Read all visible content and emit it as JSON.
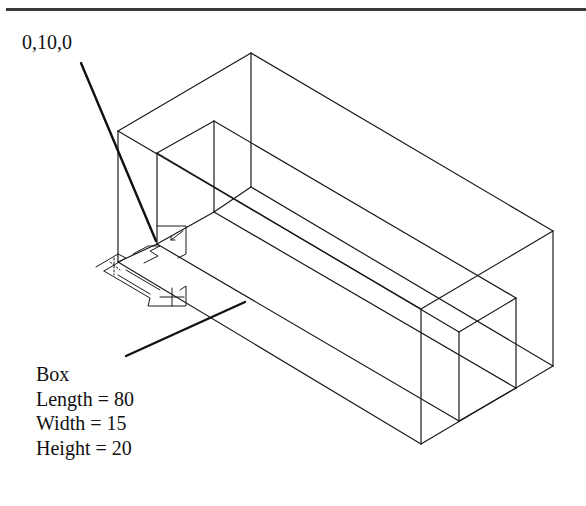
{
  "diagram": {
    "type": "isometric-wireframe",
    "colors": {
      "line": "#1a1a1a",
      "rule": "#3a3a3a",
      "background": "#ffffff"
    }
  },
  "labels": {
    "coordinate": "0,10,0",
    "spec_title": "Box",
    "spec_lines": [
      "Length = 80",
      "Width = 15",
      "Height = 20"
    ]
  },
  "icons": {
    "ucs_icon": "ucs-axis-icon"
  }
}
